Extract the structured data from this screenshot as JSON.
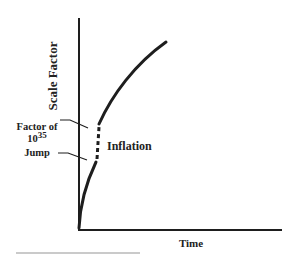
{
  "diagram": {
    "y_axis_label": "Scale Factor",
    "x_axis_label": "Time",
    "annotation": {
      "line1": "Factor of",
      "line2_base": "10",
      "line2_exponent": "35",
      "line3": "Jump"
    },
    "phase_label": "Inflation",
    "colors": {
      "ink": "#1e1e1e",
      "rule": "#b8b8b8",
      "background": "#ffffff"
    }
  }
}
